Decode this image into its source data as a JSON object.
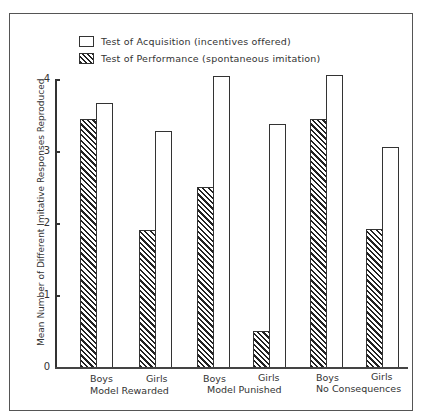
{
  "chart_data": {
    "type": "bar",
    "title": "",
    "xlabel": "",
    "ylabel": "Mean Number of Different Imitative Responses Reproduced",
    "ylim": [
      0,
      4
    ],
    "yticks": [
      0,
      1,
      2,
      3,
      4
    ],
    "grid": false,
    "legend_position": "top-left",
    "categories": [
      "Boys",
      "Girls",
      "Boys",
      "Girls",
      "Boys",
      "Girls"
    ],
    "groups": [
      "Model Rewarded",
      "Model Punished",
      "No Consequences"
    ],
    "series": [
      {
        "name": "Test of Performance (spontaneous imitation)",
        "pattern": "hatched",
        "values": [
          3.45,
          1.9,
          2.5,
          0.5,
          3.45,
          1.92
        ]
      },
      {
        "name": "Test of Acquisition (incentives offered)",
        "pattern": "open",
        "values": [
          3.66,
          3.28,
          4.04,
          3.38,
          4.06,
          3.05
        ]
      }
    ]
  },
  "legend": {
    "acquisition": "Test of Acquisition (incentives offered)",
    "performance": "Test of Performance (spontaneous imitation)"
  },
  "axis": {
    "ylabel": "Mean Number of Different Imitative Responses Reproduced",
    "ticks": [
      "0",
      "1",
      "2",
      "3",
      "4"
    ]
  },
  "xaxis": {
    "categories": [
      "Boys",
      "Girls",
      "Boys",
      "Girls",
      "Boys",
      "Girls"
    ],
    "groups": [
      "Model Rewarded",
      "Model Punished",
      "No Consequences"
    ]
  }
}
